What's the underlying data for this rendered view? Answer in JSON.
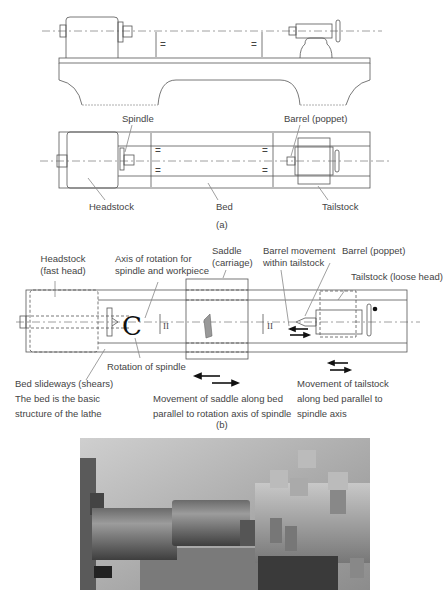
{
  "figure_a": {
    "labels": {
      "spindle": "Spindle",
      "barrel": "Barrel (poppet)",
      "headstock": "Headstock",
      "bed": "Bed",
      "tailstock": "Tailstock",
      "equal_mark": "="
    },
    "caption": "(a)"
  },
  "figure_b": {
    "labels": {
      "headstock_1": "Headstock",
      "headstock_2": "(fast head)",
      "axis_1": "Axis of rotation for",
      "axis_2": "spindle and workpiece",
      "saddle_1": "Saddle",
      "saddle_2": "(carriage)",
      "barrel_move_1": "Barrel movement",
      "barrel_move_2": "within tailstock",
      "barrel": "Barrel (poppet)",
      "tailstock": "Tailstock (loose head)",
      "rotation": "Rotation of spindle",
      "bed_1": "Bed slideways (shears)",
      "bed_2": "The bed is the basic",
      "bed_3": "structure of the lathe",
      "saddle_move_1": "Movement of saddle along bed",
      "saddle_move_2": "parallel to rotation axis of spindle",
      "tail_move_1": "Movement of tailstock",
      "tail_move_2": "along bed parallel to",
      "tail_move_3": "spindle axis",
      "parallel_mark": "II"
    },
    "caption": "(b)"
  },
  "photo": {
    "description": "Lathe turning a workpiece held in chuck, cutting tool in tool post"
  }
}
